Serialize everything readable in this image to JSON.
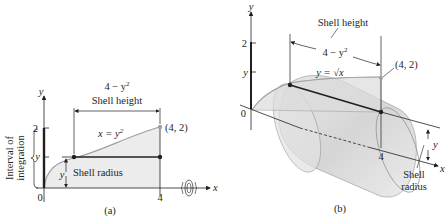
{
  "panel_a": {
    "caption": "(a)",
    "y_axis_label": "y",
    "x_axis_label": "x",
    "tick_2": "2",
    "tick_y": "y",
    "tick_0": "0",
    "tick_4": "4",
    "height_expr": "4 − y",
    "height_exp": "2",
    "shell_height_label": "Shell height",
    "curve_label": "x = y",
    "curve_exp": "2",
    "point_label": "(4, 2)",
    "radius_y": "y",
    "shell_radius_label": "Shell radius",
    "interval_line1": "Interval of",
    "interval_line2": "integration"
  },
  "panel_b": {
    "caption": "(b)",
    "y_axis_label": "y",
    "x_axis_label": "x",
    "tick_2": "2",
    "tick_y": "y",
    "tick_0": "0",
    "tick_4": "4",
    "shell_height_label": "Shell height",
    "height_expr": "4 − y",
    "height_exp": "2",
    "curve_label": "y = √x",
    "point_label": "(4, 2)",
    "radius_y": "y",
    "shell_radius_line1": "Shell",
    "shell_radius_line2": "radius"
  },
  "colors": {
    "ink": "#231f20",
    "region_fill": "#ececec",
    "curve": "#a0a0a0",
    "cylinder_fill": "#d6d6d6",
    "cylinder_edge": "#9a9a9a"
  }
}
